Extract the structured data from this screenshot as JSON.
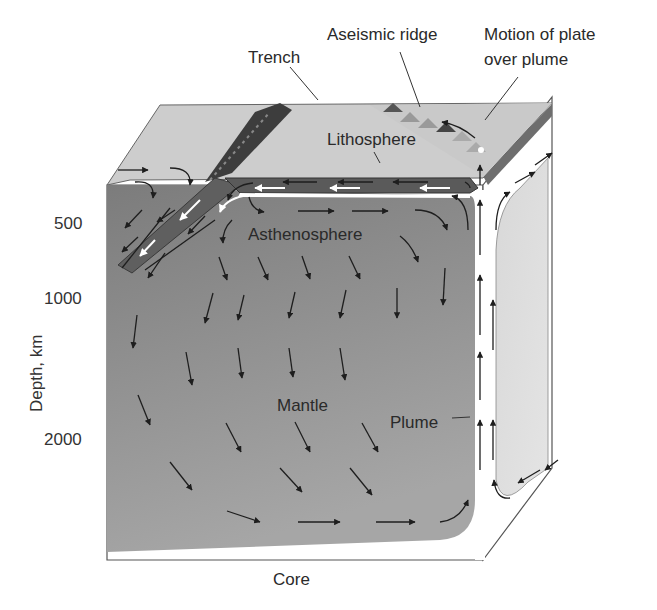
{
  "labels": {
    "trench": "Trench",
    "aseismic_ridge": "Aseismic ridge",
    "motion_line1": "Motion of plate",
    "motion_line2": "over plume",
    "lithosphere": "Lithosphere",
    "asthenosphere": "Asthenosphere",
    "mantle": "Mantle",
    "plume": "Plume",
    "core": "Core"
  },
  "axis": {
    "label": "Depth, km",
    "ticks": [
      "500",
      "1000",
      "2000"
    ]
  },
  "colors": {
    "mantle_dark": "#8a8a8a",
    "mantle_light": "#9c9c9c",
    "top_face": "#cfcfcf",
    "side_face": "#dcdcdc",
    "lithosphere_slab": "#6e6e6e",
    "outline": "#555555",
    "arrow": "#1e1e1e",
    "plume_channel": "#ffffff"
  }
}
